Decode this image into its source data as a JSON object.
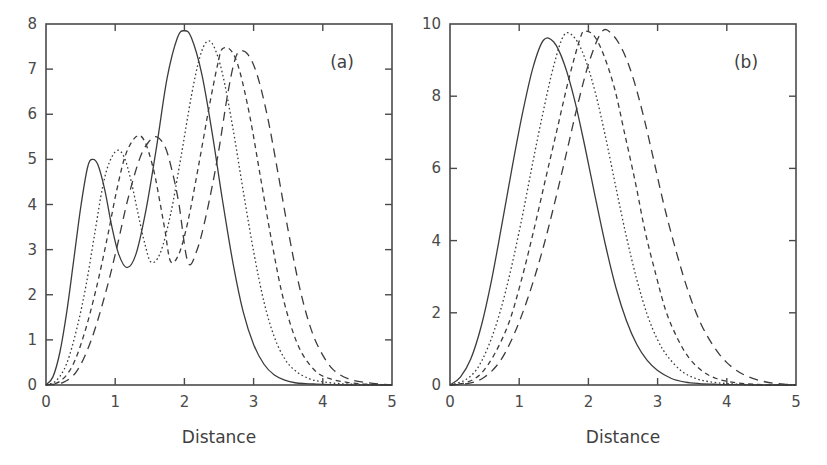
{
  "figure": {
    "background": "#ffffff",
    "line_color": "#3c3c3c",
    "axis_color": "#4a4a4a"
  },
  "chart_data": [
    {
      "type": "line",
      "panel_label": "(a)",
      "title": "",
      "xlabel": "Distance",
      "ylabel": "",
      "xlim": [
        0,
        5
      ],
      "ylim": [
        0,
        8
      ],
      "xticks": [
        0,
        1,
        2,
        3,
        4,
        5
      ],
      "yticks": [
        0,
        1,
        2,
        3,
        4,
        5,
        6,
        7,
        8
      ],
      "xticklabels": [
        "0",
        "1",
        "2",
        "3",
        "4",
        "5"
      ],
      "yticklabels": [
        "0",
        "1",
        "2",
        "3",
        "4",
        "5",
        "6",
        "7",
        "8"
      ],
      "grid": false,
      "legend": "none",
      "series": [
        {
          "name": "curve-1",
          "linestyle": "solid",
          "dasharray": "none",
          "peaks": [
            {
              "x": 0.67,
              "y": 5.0
            },
            {
              "x": 2.0,
              "y": 7.85
            }
          ],
          "valleys": [
            {
              "x": 1.17,
              "y": 2.6
            }
          ],
          "x": [
            0.0,
            0.1,
            0.2,
            0.3,
            0.4,
            0.5,
            0.6,
            0.67,
            0.75,
            0.85,
            0.95,
            1.05,
            1.17,
            1.3,
            1.45,
            1.6,
            1.75,
            1.9,
            2.0,
            2.1,
            2.25,
            2.4,
            2.55,
            2.7,
            2.85,
            3.0,
            3.15,
            3.3,
            3.45,
            3.6,
            3.75,
            3.9,
            4.1,
            4.4,
            4.7,
            5.0
          ],
          "y": [
            0.0,
            0.18,
            0.72,
            1.62,
            2.76,
            3.92,
            4.82,
            5.0,
            4.88,
            4.32,
            3.52,
            2.9,
            2.6,
            2.9,
            3.92,
            5.3,
            6.8,
            7.7,
            7.85,
            7.7,
            6.9,
            5.6,
            4.1,
            2.72,
            1.62,
            0.9,
            0.46,
            0.22,
            0.11,
            0.05,
            0.03,
            0.02,
            0.01,
            0.0,
            0.0,
            0.0
          ]
        },
        {
          "name": "curve-2",
          "linestyle": "dotted",
          "dasharray": "1.6 2.6",
          "peaks": [
            {
              "x": 1.03,
              "y": 5.2
            },
            {
              "x": 2.32,
              "y": 7.6
            }
          ],
          "valleys": [
            {
              "x": 1.52,
              "y": 2.72
            }
          ],
          "x": [
            0.0,
            0.15,
            0.3,
            0.45,
            0.58,
            0.7,
            0.82,
            0.92,
            1.03,
            1.13,
            1.23,
            1.33,
            1.43,
            1.52,
            1.65,
            1.8,
            1.95,
            2.1,
            2.22,
            2.32,
            2.42,
            2.55,
            2.7,
            2.85,
            3.0,
            3.15,
            3.3,
            3.45,
            3.6,
            3.8,
            4.0,
            4.25,
            4.55,
            4.8,
            5.0
          ],
          "y": [
            0.0,
            0.1,
            0.48,
            1.28,
            2.22,
            3.32,
            4.4,
            4.95,
            5.2,
            5.05,
            4.52,
            3.8,
            3.12,
            2.72,
            2.92,
            3.78,
            5.05,
            6.4,
            7.25,
            7.6,
            7.52,
            6.9,
            5.7,
            4.3,
            2.96,
            1.84,
            1.06,
            0.58,
            0.32,
            0.14,
            0.07,
            0.03,
            0.01,
            0.0,
            0.0
          ]
        },
        {
          "name": "curve-3",
          "linestyle": "dashed-short",
          "dasharray": "5 4",
          "peaks": [
            {
              "x": 1.3,
              "y": 5.5
            },
            {
              "x": 2.55,
              "y": 7.45
            }
          ],
          "valleys": [
            {
              "x": 1.8,
              "y": 2.74
            }
          ],
          "x": [
            0.0,
            0.2,
            0.38,
            0.55,
            0.72,
            0.88,
            1.02,
            1.15,
            1.3,
            1.42,
            1.55,
            1.65,
            1.72,
            1.8,
            1.92,
            2.05,
            2.2,
            2.35,
            2.48,
            2.55,
            2.68,
            2.8,
            2.95,
            3.1,
            3.25,
            3.4,
            3.55,
            3.7,
            3.9,
            4.1,
            4.35,
            4.6,
            4.85,
            5.0
          ],
          "y": [
            0.0,
            0.08,
            0.42,
            1.12,
            2.1,
            3.22,
            4.3,
            5.1,
            5.5,
            5.42,
            4.8,
            4.02,
            3.42,
            2.74,
            2.9,
            3.62,
            4.82,
            6.1,
            7.1,
            7.45,
            7.4,
            6.95,
            5.92,
            4.6,
            3.28,
            2.1,
            1.26,
            0.7,
            0.3,
            0.14,
            0.06,
            0.02,
            0.01,
            0.0
          ]
        },
        {
          "name": "curve-4",
          "linestyle": "dashed-long",
          "dasharray": "9 6",
          "peaks": [
            {
              "x": 1.6,
              "y": 5.5
            },
            {
              "x": 2.8,
              "y": 7.4
            }
          ],
          "valleys": [
            {
              "x": 2.05,
              "y": 2.72
            }
          ],
          "x": [
            0.0,
            0.25,
            0.45,
            0.65,
            0.85,
            1.02,
            1.18,
            1.35,
            1.48,
            1.6,
            1.72,
            1.82,
            1.92,
            2.05,
            2.18,
            2.32,
            2.48,
            2.62,
            2.72,
            2.8,
            2.92,
            3.05,
            3.2,
            3.35,
            3.5,
            3.65,
            3.8,
            3.95,
            4.15,
            4.4,
            4.65,
            4.85,
            5.0
          ],
          "y": [
            0.0,
            0.06,
            0.32,
            0.98,
            1.98,
            3.02,
            4.1,
            5.0,
            5.38,
            5.5,
            5.28,
            4.76,
            4.02,
            2.72,
            2.98,
            3.8,
            5.05,
            6.4,
            7.15,
            7.4,
            7.32,
            6.88,
            5.95,
            4.72,
            3.42,
            2.26,
            1.38,
            0.8,
            0.34,
            0.12,
            0.05,
            0.02,
            0.0
          ]
        }
      ]
    },
    {
      "type": "line",
      "panel_label": "(b)",
      "title": "",
      "xlabel": "Distance",
      "ylabel": "",
      "xlim": [
        0,
        5
      ],
      "ylim": [
        0,
        10
      ],
      "xticks": [
        0,
        1,
        2,
        3,
        4,
        5
      ],
      "yticks": [
        0,
        2,
        4,
        6,
        8,
        10
      ],
      "xticklabels": [
        "0",
        "1",
        "2",
        "3",
        "4",
        "5"
      ],
      "yticklabels": [
        "0",
        "2",
        "4",
        "6",
        "8",
        "10"
      ],
      "grid": false,
      "legend": "none",
      "series": [
        {
          "name": "curve-1",
          "linestyle": "solid",
          "dasharray": "none",
          "peaks": [
            {
              "x": 1.35,
              "y": 9.55
            }
          ],
          "x": [
            0.0,
            0.15,
            0.3,
            0.45,
            0.6,
            0.75,
            0.9,
            1.05,
            1.2,
            1.35,
            1.5,
            1.65,
            1.8,
            1.95,
            2.1,
            2.25,
            2.4,
            2.55,
            2.7,
            2.85,
            3.0,
            3.2,
            3.4,
            3.6,
            3.85,
            4.1,
            4.4,
            4.7,
            5.0
          ],
          "y": [
            0.0,
            0.22,
            0.72,
            1.62,
            2.9,
            4.45,
            6.05,
            7.55,
            8.8,
            9.55,
            9.5,
            8.9,
            7.9,
            6.6,
            5.2,
            3.85,
            2.68,
            1.78,
            1.12,
            0.68,
            0.4,
            0.18,
            0.08,
            0.04,
            0.02,
            0.01,
            0.0,
            0.0,
            0.0
          ]
        },
        {
          "name": "curve-2",
          "linestyle": "dotted",
          "dasharray": "1.6 2.6",
          "peaks": [
            {
              "x": 1.65,
              "y": 9.7
            }
          ],
          "x": [
            0.0,
            0.2,
            0.38,
            0.55,
            0.72,
            0.88,
            1.05,
            1.2,
            1.35,
            1.5,
            1.65,
            1.8,
            1.95,
            2.1,
            2.25,
            2.4,
            2.55,
            2.7,
            2.85,
            3.0,
            3.15,
            3.35,
            3.55,
            3.75,
            4.0,
            4.3,
            4.6,
            4.85,
            5.0
          ],
          "y": [
            0.0,
            0.12,
            0.42,
            1.05,
            2.0,
            3.2,
            4.72,
            6.2,
            7.6,
            8.85,
            9.7,
            9.62,
            9.05,
            8.1,
            6.85,
            5.45,
            4.1,
            2.92,
            1.95,
            1.25,
            0.78,
            0.38,
            0.18,
            0.09,
            0.04,
            0.01,
            0.0,
            0.0,
            0.0
          ]
        },
        {
          "name": "curve-3",
          "linestyle": "dashed-short",
          "dasharray": "5 4",
          "peaks": [
            {
              "x": 1.95,
              "y": 9.8
            }
          ],
          "x": [
            0.0,
            0.25,
            0.45,
            0.65,
            0.85,
            1.02,
            1.2,
            1.38,
            1.55,
            1.72,
            1.88,
            1.95,
            2.08,
            2.22,
            2.38,
            2.52,
            2.68,
            2.82,
            2.98,
            3.12,
            3.28,
            3.45,
            3.65,
            3.85,
            4.1,
            4.4,
            4.7,
            5.0
          ],
          "y": [
            0.0,
            0.08,
            0.32,
            0.88,
            1.72,
            2.82,
            4.2,
            5.7,
            7.1,
            8.5,
            9.6,
            9.8,
            9.68,
            9.15,
            8.2,
            7.0,
            5.6,
            4.25,
            3.02,
            2.05,
            1.32,
            0.76,
            0.38,
            0.18,
            0.07,
            0.02,
            0.0,
            0.0
          ]
        },
        {
          "name": "curve-4",
          "linestyle": "dashed-long",
          "dasharray": "9 6",
          "peaks": [
            {
              "x": 2.2,
              "y": 9.8
            }
          ],
          "x": [
            0.0,
            0.28,
            0.5,
            0.72,
            0.92,
            1.12,
            1.32,
            1.5,
            1.68,
            1.85,
            2.02,
            2.2,
            2.35,
            2.5,
            2.65,
            2.8,
            2.95,
            3.1,
            3.28,
            3.45,
            3.62,
            3.8,
            4.0,
            4.25,
            4.55,
            4.85,
            5.0
          ],
          "y": [
            0.0,
            0.05,
            0.22,
            0.65,
            1.38,
            2.38,
            3.62,
            4.95,
            6.4,
            7.8,
            9.0,
            9.8,
            9.7,
            9.25,
            8.48,
            7.42,
            6.18,
            4.92,
            3.62,
            2.55,
            1.72,
            1.1,
            0.62,
            0.28,
            0.09,
            0.02,
            0.0
          ]
        }
      ]
    }
  ]
}
